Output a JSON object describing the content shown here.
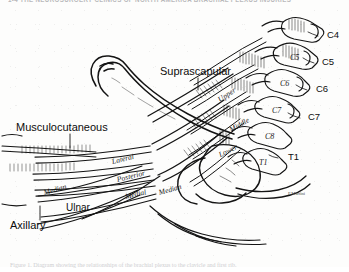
{
  "header": {
    "running_head": "1-4   THE NEUROSURGERY CLINICS OF NORTH AMERICA  BRACHIAL PLEXUS INJURIES"
  },
  "caption": {
    "text": "Figure 1. Diagram showing the relationships of the brachial plexus to the clavicle and first rib."
  },
  "figure": {
    "nerve_labels": [
      {
        "id": "suprascapular",
        "text": "Suprascapular"
      },
      {
        "id": "musculocutaneous",
        "text": "Musculocutaneous"
      },
      {
        "id": "median-left",
        "text": "Median"
      },
      {
        "id": "ulnar",
        "text": "Ulnar"
      },
      {
        "id": "axillary",
        "text": "Axillary"
      }
    ],
    "trunk_labels": [
      {
        "id": "upper-trunk",
        "text": "Upper"
      },
      {
        "id": "middle-trunk",
        "text": "Middle"
      },
      {
        "id": "lower-trunk",
        "text": "Lower"
      }
    ],
    "cord_labels": [
      {
        "id": "lateral-cord",
        "text": "Lateral"
      },
      {
        "id": "posterior-cord",
        "text": "Posterior"
      },
      {
        "id": "medial-cord",
        "text": "Medial"
      },
      {
        "id": "median-right",
        "text": "Median"
      }
    ],
    "root_labels_outer": [
      {
        "id": "root-c4",
        "text": "C4"
      },
      {
        "id": "root-c5",
        "text": "C5"
      },
      {
        "id": "root-c6",
        "text": "C6"
      },
      {
        "id": "root-c7",
        "text": "C7"
      },
      {
        "id": "root-t1",
        "text": "T1"
      }
    ],
    "vertebra_labels_inner": [
      {
        "id": "vert-c5",
        "text": "C5"
      },
      {
        "id": "vert-c6",
        "text": "C6"
      },
      {
        "id": "vert-c7",
        "text": "C7"
      },
      {
        "id": "vert-c8",
        "text": "C8"
      },
      {
        "id": "vert-t1",
        "text": "T1"
      }
    ],
    "artist_signature": "F.Martini",
    "colors": {
      "ink": "#111111",
      "paper": "#fdfdfc",
      "faded_text": "#c2c2c5"
    }
  }
}
